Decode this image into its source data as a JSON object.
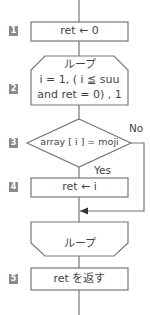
{
  "flowchart": {
    "steps": [
      {
        "number": "1",
        "type": "process",
        "text": "ret ← 0"
      },
      {
        "number": "2",
        "type": "loop-start",
        "lines": [
          "ループ",
          "i = 1, ( i ≦ suu",
          "and ret = 0) , 1"
        ]
      },
      {
        "number": "3",
        "type": "decision",
        "text": "array [ i ] = moji",
        "yes_label": "Yes",
        "no_label": "No"
      },
      {
        "number": "4",
        "type": "process",
        "text": "ret ← i"
      },
      {
        "number": "",
        "type": "loop-end",
        "text": "ループ"
      },
      {
        "number": "5",
        "type": "process",
        "text": "ret を返す"
      }
    ]
  },
  "colors": {
    "line": "#777777",
    "badge": "#8a8a8a",
    "text": "#444444"
  }
}
